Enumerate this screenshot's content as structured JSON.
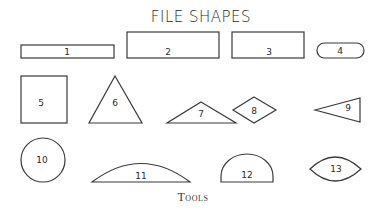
{
  "title": "FILE SHAPES",
  "caption": "Tools",
  "shapes": [
    {
      "id": "1",
      "type": "thin-rectangle"
    },
    {
      "id": "2",
      "type": "rectangle"
    },
    {
      "id": "3",
      "type": "rectangle"
    },
    {
      "id": "4",
      "type": "rounded-rectangle"
    },
    {
      "id": "5",
      "type": "square"
    },
    {
      "id": "6",
      "type": "equilateral-triangle"
    },
    {
      "id": "7",
      "type": "obtuse-triangle"
    },
    {
      "id": "8",
      "type": "diamond"
    },
    {
      "id": "9",
      "type": "narrow-triangle"
    },
    {
      "id": "10",
      "type": "circle"
    },
    {
      "id": "11",
      "type": "segment"
    },
    {
      "id": "12",
      "type": "half-round"
    },
    {
      "id": "13",
      "type": "lens"
    }
  ]
}
